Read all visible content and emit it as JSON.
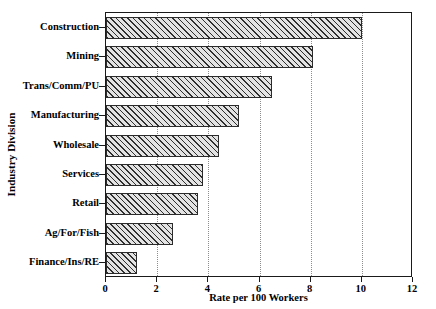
{
  "chart_data": {
    "type": "bar",
    "orientation": "horizontal",
    "title": "",
    "xlabel": "Rate per 100 Workers",
    "ylabel": "Industry Division",
    "categories": [
      "Construction",
      "Mining",
      "Trans/Comm/PU",
      "Manufacturing",
      "Wholesale",
      "Services",
      "Retail",
      "Ag/For/Fish",
      "Finance/Ins/RE"
    ],
    "values": [
      10.0,
      8.1,
      6.5,
      5.2,
      4.4,
      3.8,
      3.6,
      2.6,
      1.2
    ],
    "xlim": [
      0,
      12
    ],
    "xticks": [
      0,
      2,
      4,
      6,
      8,
      10,
      12
    ],
    "xtick_labels": [
      "0",
      "2",
      "4",
      "6",
      "8",
      "10",
      "12"
    ],
    "grid": "vertical-dotted",
    "legend": "none",
    "bar_fill": "#e3e3e3",
    "bar_hatch": "diagonal",
    "bar_edge_color": "#2b2b2b",
    "axis_color": "#1a1a1a",
    "gridline_color": "#8d8d8d"
  }
}
